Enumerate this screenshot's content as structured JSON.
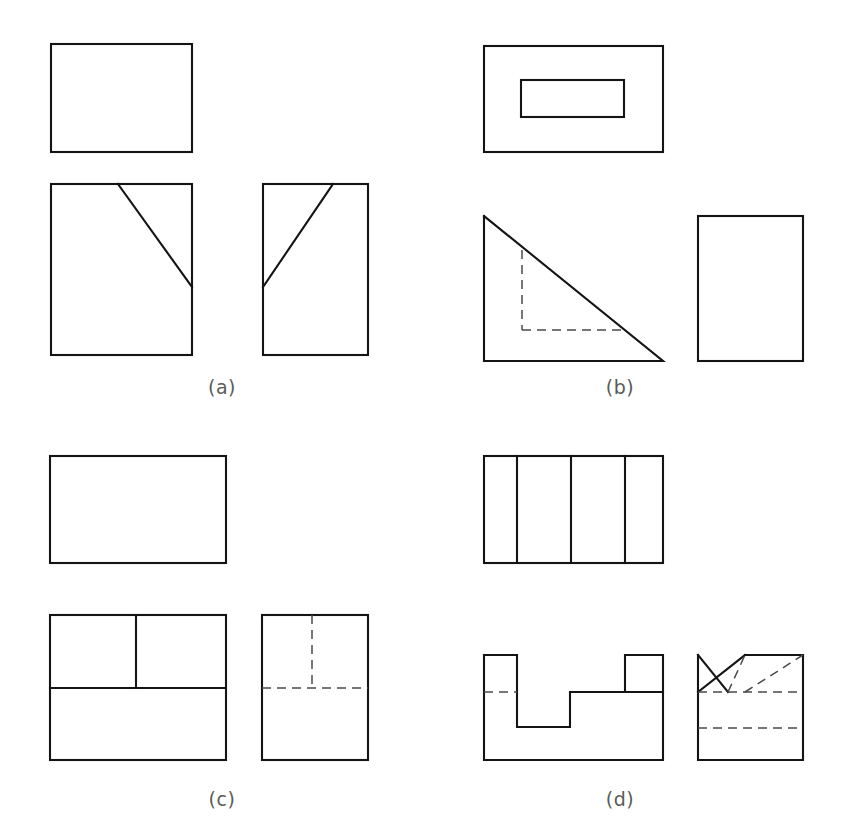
{
  "sheet": {
    "title": "Orthographic projection exercise sheet",
    "background_color": "#ffffff",
    "line_color": "#141414",
    "hidden_line_color": "#4a4a4a",
    "caption_color": "#5a5a5a",
    "width": 850,
    "height": 836
  },
  "panels": [
    {
      "id": "a",
      "caption": "(a)",
      "caption_x": 222,
      "caption_y": 394,
      "views": {
        "top": {
          "label": "top-view",
          "x": 51,
          "y": 44,
          "w": 141,
          "h": 108
        },
        "front": {
          "label": "front-view",
          "x": 51,
          "y": 184,
          "w": 141,
          "h": 171,
          "diagonal": {
            "x1": 118,
            "y1": 184,
            "x2": 192,
            "y2": 287
          }
        },
        "side": {
          "label": "side-view",
          "x": 263,
          "y": 184,
          "w": 105,
          "h": 171,
          "diagonal": {
            "x1": 263,
            "y1": 287,
            "x2": 333,
            "y2": 184
          }
        }
      }
    },
    {
      "id": "b",
      "caption": "(b)",
      "caption_x": 620,
      "caption_y": 394,
      "views": {
        "top": {
          "label": "top-view",
          "x": 484,
          "y": 46,
          "w": 179,
          "h": 106,
          "inner": {
            "x": 521,
            "y": 80,
            "w": 103,
            "h": 37
          }
        },
        "front": {
          "label": "front-view-triangle",
          "points": "484,216 484,361 663,361",
          "hidden_vertical": {
            "x1": 522,
            "y1": 250,
            "x2": 522,
            "y2": 330
          },
          "hidden_horizontal": {
            "x1": 522,
            "y1": 330,
            "x2": 626,
            "y2": 330
          }
        },
        "side": {
          "label": "side-view",
          "x": 698,
          "y": 216,
          "w": 105,
          "h": 145
        }
      }
    },
    {
      "id": "c",
      "caption": "(c)",
      "caption_x": 222,
      "caption_y": 806,
      "views": {
        "top": {
          "label": "top-view",
          "x": 50,
          "y": 456,
          "w": 176,
          "h": 107
        },
        "front": {
          "label": "front-view",
          "x": 50,
          "y": 615,
          "w": 176,
          "h": 145,
          "divider_horizontal": {
            "x1": 50,
            "y1": 688,
            "x2": 226,
            "y2": 688
          },
          "divider_vertical": {
            "x1": 136,
            "y1": 615,
            "x2": 136,
            "y2": 688
          }
        },
        "side": {
          "label": "side-view",
          "x": 262,
          "y": 615,
          "w": 106,
          "h": 145,
          "hidden_horizontal": {
            "x1": 262,
            "y1": 688,
            "x2": 368,
            "y2": 688
          },
          "hidden_vertical": {
            "x1": 312,
            "y1": 615,
            "x2": 312,
            "y2": 688
          }
        }
      }
    },
    {
      "id": "d",
      "caption": "(d)",
      "caption_x": 620,
      "caption_y": 806,
      "views": {
        "top": {
          "label": "top-view",
          "x": 484,
          "y": 456,
          "w": 179,
          "h": 107,
          "dividers": [
            517,
            571,
            625
          ]
        },
        "front": {
          "label": "front-view-stepped",
          "outline": "484,655 517,655 517,727 570,727 570,692 625,692 625,655 663,655 663,760 484,760 484,655",
          "ledge": {
            "x1": 570,
            "y1": 692,
            "x2": 663,
            "y2": 692
          },
          "hidden_horizontal": {
            "x1": 484,
            "y1": 692,
            "x2": 517,
            "y2": 692
          }
        },
        "side": {
          "label": "side-view",
          "x": 698,
          "y": 655,
          "w": 105,
          "h": 105,
          "solid_top_edge": {
            "x1": 745,
            "y1": 655,
            "x2": 803,
            "y2": 655
          },
          "solid_diag_down": {
            "x1": 698,
            "y1": 655,
            "x2": 728,
            "y2": 692
          },
          "solid_diag_up": {
            "x1": 698,
            "y1": 692,
            "x2": 745,
            "y2": 655
          },
          "hidden_v_left": {
            "x1": 728,
            "y1": 692,
            "x2": 745,
            "y2": 655
          },
          "hidden_v_right": {
            "x1": 745,
            "y1": 692,
            "x2": 803,
            "y2": 655
          },
          "hidden_horizontal_upper": {
            "x1": 698,
            "y1": 692,
            "x2": 803,
            "y2": 692
          },
          "hidden_horizontal_lower": {
            "x1": 698,
            "y1": 728,
            "x2": 803,
            "y2": 728
          }
        }
      }
    }
  ]
}
